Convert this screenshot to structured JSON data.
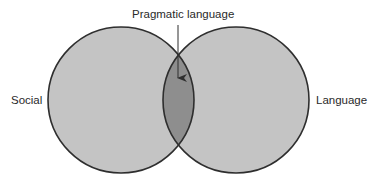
{
  "diagram": {
    "type": "venn",
    "sets": [
      {
        "label": "Social",
        "cx": 121,
        "cy": 100,
        "r": 73
      },
      {
        "label": "Language",
        "cx": 236,
        "cy": 100,
        "r": 73
      }
    ],
    "intersection": {
      "label": "Pragmatic language"
    },
    "colors": {
      "circle_fill": "#c4c4c4",
      "overlap_fill": "#8e8e8e",
      "stroke": "#2e2e2e",
      "text": "#2a2a2a",
      "background": "#ffffff"
    },
    "arrow": {
      "x": 178,
      "y1": 25,
      "y2": 78
    }
  }
}
